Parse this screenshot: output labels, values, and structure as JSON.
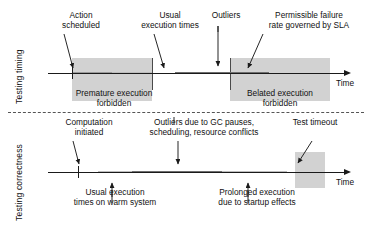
{
  "figure": {
    "panels": [
      {
        "id": "testing-timing",
        "side_label": "Testing timing",
        "axis_label": "Time",
        "callouts_above": [
          {
            "id": "action-scheduled",
            "line1": "Action",
            "line2": "scheduled"
          },
          {
            "id": "usual-execution-times",
            "line1": "Usual",
            "line2": "execution times"
          },
          {
            "id": "outliers",
            "line1": "Outliers",
            "line2": ""
          },
          {
            "id": "permissible-failure-rate",
            "line1": "Permissible failure",
            "line2": "rate governed by SLA"
          }
        ],
        "callouts_below": [
          {
            "id": "premature-execution-forbidden",
            "line1": "Premature execution",
            "line2": "forbidden"
          },
          {
            "id": "belated-execution-forbidden",
            "line1": "Belated execution",
            "line2": "forbidden"
          }
        ],
        "bands": [
          {
            "id": "premature-forbidden-band",
            "x": 72,
            "width": 80
          },
          {
            "id": "belated-forbidden-band",
            "x": 230,
            "width": 100
          }
        ],
        "segments": [
          {
            "id": "segment-usual",
            "x": 72,
            "width": 40,
            "shade": "mid"
          },
          {
            "id": "segment-tail",
            "x": 112,
            "width": 40,
            "shade": "light"
          },
          {
            "id": "segment-outliers",
            "x": 175,
            "width": 94,
            "shade": "dark"
          }
        ]
      },
      {
        "id": "testing-correctness",
        "side_label": "Testing correctness",
        "axis_label": "Time",
        "callouts_above": [
          {
            "id": "computation-initiated",
            "line1": "Computation",
            "line2": "initiated"
          },
          {
            "id": "outliers-gc-pauses",
            "line1": "Outliers due to GC pauses,",
            "line2": "scheduling, resource conflicts"
          },
          {
            "id": "test-timeout",
            "line1": "Test timeout",
            "line2": ""
          }
        ],
        "callouts_below": [
          {
            "id": "usual-execution-warm-system",
            "line1": "Usual execution",
            "line2": "times on warm system"
          },
          {
            "id": "prolonged-execution-startup",
            "line1": "Prolonged execution",
            "line2": "due to startup effects"
          }
        ],
        "bands": [
          {
            "id": "test-timeout-band",
            "x": 295,
            "width": 30
          }
        ],
        "segments": [
          {
            "id": "segment-warm",
            "x": 98,
            "width": 34,
            "shade": "light"
          },
          {
            "id": "segment-outliers",
            "x": 132,
            "width": 90,
            "shade": "dark"
          },
          {
            "id": "segment-startup",
            "x": 222,
            "width": 65,
            "shade": "light"
          }
        ]
      }
    ],
    "colors": {
      "band": "#d2d2d2",
      "segment_dark": "#6e6e6e",
      "segment_mid": "#9a9a9a",
      "segment_light": "#bdbdbd",
      "axis": "#1a1a1a",
      "divider": "#555555"
    }
  }
}
